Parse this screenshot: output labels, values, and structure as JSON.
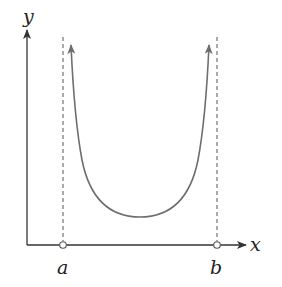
{
  "diagram": {
    "axes": {
      "x_label": "x",
      "y_label": "y"
    },
    "points": {
      "left_endpoint_label": "a",
      "right_endpoint_label": "b",
      "endpoint_style": "open-circle"
    },
    "asymptotes": [
      {
        "name": "x = a",
        "style": "dashed"
      },
      {
        "name": "x = b",
        "style": "dashed"
      }
    ],
    "colors": {
      "axis": "#333333",
      "curve": "#6e6e6e",
      "dashed": "#555555"
    }
  }
}
